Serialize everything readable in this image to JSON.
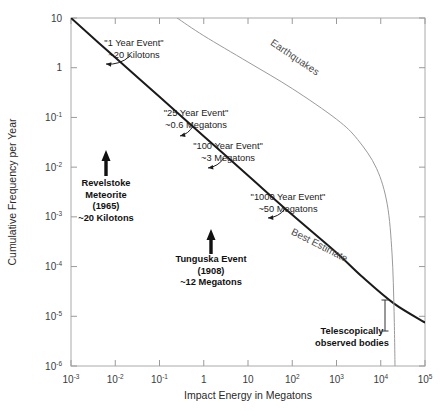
{
  "chart_data": {
    "type": "line",
    "title": "",
    "xlabel": "Impact Energy in Megatons",
    "ylabel": "Cumulative Frequency per Year",
    "xlim": [
      0.001,
      100000
    ],
    "ylim": [
      1e-06,
      10
    ],
    "xscale": "log",
    "yscale": "log",
    "grid": false,
    "legend": "none",
    "xticks": [
      {
        "value": 0.001,
        "mantissa": "10",
        "exponent": "-3"
      },
      {
        "value": 0.01,
        "mantissa": "10",
        "exponent": "-2"
      },
      {
        "value": 0.1,
        "mantissa": "10",
        "exponent": "-1"
      },
      {
        "value": 1,
        "mantissa": "1",
        "exponent": ""
      },
      {
        "value": 10,
        "mantissa": "10",
        "exponent": ""
      },
      {
        "value": 100,
        "mantissa": "10",
        "exponent": "2"
      },
      {
        "value": 1000,
        "mantissa": "10",
        "exponent": "3"
      },
      {
        "value": 10000,
        "mantissa": "10",
        "exponent": "4"
      },
      {
        "value": 100000,
        "mantissa": "10",
        "exponent": "5"
      }
    ],
    "yticks": [
      {
        "value": 10,
        "mantissa": "10",
        "exponent": ""
      },
      {
        "value": 1,
        "mantissa": "1",
        "exponent": ""
      },
      {
        "value": 0.1,
        "mantissa": "10",
        "exponent": "-1"
      },
      {
        "value": 0.01,
        "mantissa": "10",
        "exponent": "-2"
      },
      {
        "value": 0.001,
        "mantissa": "10",
        "exponent": "-3"
      },
      {
        "value": 0.0001,
        "mantissa": "10",
        "exponent": "-4"
      },
      {
        "value": 1e-05,
        "mantissa": "10",
        "exponent": "-5"
      },
      {
        "value": 1e-06,
        "mantissa": "10",
        "exponent": "-6"
      }
    ],
    "series": [
      {
        "name": "Best Estimate",
        "color": "#1a1a1a",
        "width": 2.0,
        "points": [
          [
            0.001,
            10
          ],
          [
            0.01,
            1.6
          ],
          [
            0.1,
            0.26
          ],
          [
            1,
            0.042
          ],
          [
            10,
            0.0068
          ],
          [
            100,
            0.0011
          ],
          [
            1000,
            0.00019
          ],
          [
            4000,
            6e-05
          ],
          [
            20000,
            1.8e-05
          ],
          [
            100000,
            7.5e-06
          ]
        ]
      },
      {
        "name": "Earthquakes",
        "color": "#9a9a9a",
        "width": 1.0,
        "points": [
          [
            0.25,
            10
          ],
          [
            1,
            4.4
          ],
          [
            10,
            1.3
          ],
          [
            100,
            0.38
          ],
          [
            1000,
            0.092
          ],
          [
            3000,
            0.036
          ],
          [
            8000,
            0.0095
          ],
          [
            14000,
            0.0018
          ],
          [
            18000,
            0.00018
          ],
          [
            20000,
            1.25e-05
          ],
          [
            21000,
            1e-06
          ]
        ]
      }
    ],
    "annotations": [
      {
        "name": "one-year-event",
        "lines": [
          "\"1 Year Event\"",
          "~20 Kilotons"
        ],
        "text_x": 134,
        "text_y": 46,
        "arrow_from": [
          130,
          56
        ],
        "arrow_to": [
          106,
          64
        ]
      },
      {
        "name": "twentyfive-year-event",
        "lines": [
          "\"25 Year Event\"",
          "~0.6 Megatons"
        ],
        "text_x": 196,
        "text_y": 116,
        "arrow_from": [
          193,
          126
        ],
        "arrow_to": [
          180,
          136
        ]
      },
      {
        "name": "hundred-year-event",
        "lines": [
          "\"100 Year Event\"",
          "~3 Megatons"
        ],
        "text_x": 228,
        "text_y": 149,
        "arrow_from": [
          224,
          158
        ],
        "arrow_to": [
          208,
          168
        ]
      },
      {
        "name": "thousand-year-event",
        "lines": [
          "\"1000 Year Event\"",
          "~50 Megatons"
        ],
        "text_x": 288,
        "text_y": 200,
        "arrow_from": [
          285,
          209
        ],
        "arrow_to": [
          268,
          218
        ]
      },
      {
        "name": "revelstoke-meteorite",
        "lines": [
          "Revelstoke",
          "Meteorite",
          "(1965)",
          "~20 Kilotons"
        ],
        "text_x": 106,
        "text_y": 186,
        "arrow_x": 106,
        "arrow_top": 150,
        "arrow_bottom": 176
      },
      {
        "name": "tunguska-event",
        "lines": [
          "Tunguska Event",
          "(1908)",
          "~12 Megatons"
        ],
        "text_x": 211,
        "text_y": 262,
        "arrow_x": 211,
        "arrow_top": 229,
        "arrow_bottom": 254
      },
      {
        "name": "telescopically-observed-bodies",
        "lines": [
          "Telescopically",
          "observed bodies"
        ],
        "text_x": 352,
        "text_y": 334,
        "errorbar_x": 385,
        "errorbar_top": 300,
        "errorbar_bottom": 331
      }
    ],
    "curve_labels": [
      {
        "name": "earthquakes-label",
        "text": "Earthquakes",
        "x": 293,
        "y": 60,
        "rotation": 34,
        "color": "#6a6a6a"
      },
      {
        "name": "best-estimate-label",
        "text": "Best Estimate",
        "x": 318,
        "y": 248,
        "rotation": 27,
        "color": "#1a1a1a"
      }
    ]
  },
  "axes": {
    "x_title": "Impact Energy in Megatons",
    "y_title": "Cumulative Frequency per Year"
  }
}
